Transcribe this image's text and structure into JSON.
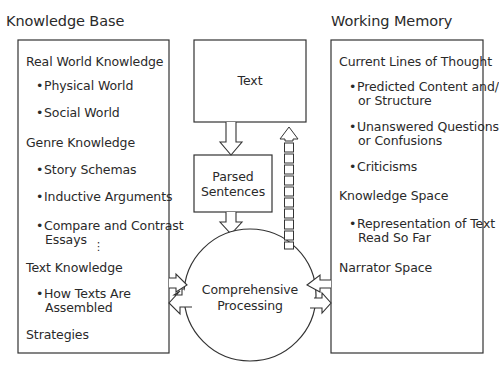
{
  "knowledge_base": {
    "title": "Knowledge Base",
    "items": [
      {
        "type": "heading",
        "text": "Real World Knowledge"
      },
      {
        "type": "bullet",
        "text": "Physical World"
      },
      {
        "type": "bullet",
        "text": "Social World"
      },
      {
        "type": "heading",
        "text": "Genre Knowledge"
      },
      {
        "type": "bullet",
        "text": "Story Schemas"
      },
      {
        "type": "bullet",
        "text": "Inductive Arguments"
      },
      {
        "type": "bullet",
        "lines": [
          "Compare and Contrast",
          "Essays"
        ]
      },
      {
        "type": "ellipsis",
        "text": "⋮"
      },
      {
        "type": "heading",
        "text": "Text Knowledge"
      },
      {
        "type": "bullet",
        "lines": [
          "How Texts Are",
          "Assembled"
        ]
      },
      {
        "type": "heading",
        "text": "Strategies"
      }
    ]
  },
  "working_memory": {
    "title": "Working Memory",
    "items": [
      {
        "type": "heading",
        "text": "Current Lines of Thought"
      },
      {
        "type": "bullet",
        "lines": [
          "Predicted Content and/",
          "or Structure"
        ]
      },
      {
        "type": "bullet",
        "lines": [
          "Unanswered Questions",
          "or Confusions"
        ]
      },
      {
        "type": "bullet",
        "text": "Criticisms"
      },
      {
        "type": "heading",
        "text": "Knowledge Space"
      },
      {
        "type": "bullet",
        "lines": [
          "Representation of Text",
          "Read So Far"
        ]
      },
      {
        "type": "heading",
        "text": "Narrator Space"
      }
    ]
  },
  "text_box": {
    "label": "Text"
  },
  "parsed_box": {
    "lines": [
      "Parsed",
      "Sentences"
    ]
  },
  "processing": {
    "lines": [
      "Comprehensive",
      "Processing"
    ]
  },
  "colors": {
    "stroke": "#333333",
    "text": "#2a2a2a",
    "background": "#ffffff"
  }
}
